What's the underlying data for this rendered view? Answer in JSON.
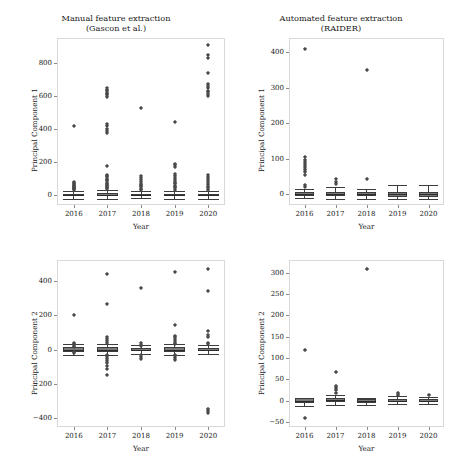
{
  "figure": {
    "xlabel": "Year",
    "categories": [
      "2016",
      "2017",
      "2018",
      "2019",
      "2020"
    ]
  },
  "panels": {
    "top_left": {
      "title": "Manual feature extraction\n(Gascon et al.)",
      "ylabel": "Principal Component 1",
      "yticks": [
        "0",
        "200",
        "400",
        "600",
        "800"
      ]
    },
    "top_right": {
      "title": "Automated feature extraction\n(RAIDER)",
      "ylabel": "Principal Component 1",
      "yticks": [
        "0",
        "100",
        "200",
        "300",
        "400"
      ]
    },
    "bottom_left": {
      "title": "",
      "ylabel": "Principal Component 2",
      "yticks": [
        "−400",
        "−200",
        "0",
        "200",
        "400"
      ]
    },
    "bottom_right": {
      "title": "",
      "ylabel": "Principal Component 2",
      "yticks": [
        "−50",
        "0",
        "50",
        "100",
        "150",
        "200",
        "250",
        "300"
      ]
    }
  },
  "chart_data": [
    {
      "id": "top_left",
      "type": "box",
      "title": "Manual feature extraction (Gascon et al.)",
      "xlabel": "Year",
      "ylabel": "Principal Component 1",
      "categories": [
        "2016",
        "2017",
        "2018",
        "2019",
        "2020"
      ],
      "ylim": [
        -60,
        950
      ],
      "yticks": [
        0,
        200,
        400,
        600,
        800
      ],
      "grid": false,
      "legend": "none",
      "boxes": [
        {
          "category": "2016",
          "q1": -6,
          "median": 0,
          "q3": 8,
          "whisker_low": -22,
          "whisker_high": 24,
          "outliers": [
            30,
            34,
            38,
            42,
            46,
            50,
            55,
            60,
            66,
            72,
            80,
            415
          ]
        },
        {
          "category": "2017",
          "q1": -8,
          "median": 0,
          "q3": 10,
          "whisker_low": -26,
          "whisker_high": 30,
          "outliers": [
            36,
            42,
            48,
            54,
            60,
            68,
            76,
            84,
            92,
            100,
            108,
            116,
            124,
            178,
            375,
            385,
            400,
            418,
            430,
            595,
            605,
            612,
            620,
            628,
            636,
            645
          ]
        },
        {
          "category": "2018",
          "q1": -6,
          "median": 0,
          "q3": 7,
          "whisker_low": -20,
          "whisker_high": 22,
          "outliers": [
            30,
            38,
            46,
            54,
            62,
            70,
            80,
            92,
            104,
            118,
            524
          ]
        },
        {
          "category": "2019",
          "q1": -7,
          "median": 0,
          "q3": 9,
          "whisker_low": -24,
          "whisker_high": 26,
          "outliers": [
            32,
            40,
            48,
            56,
            64,
            72,
            82,
            92,
            104,
            116,
            128,
            170,
            182,
            190,
            443
          ]
        },
        {
          "category": "2020",
          "q1": -6,
          "median": 0,
          "q3": 8,
          "whisker_low": -22,
          "whisker_high": 24,
          "outliers": [
            30,
            40,
            50,
            60,
            72,
            84,
            96,
            110,
            124,
            600,
            612,
            622,
            632,
            645,
            660,
            672,
            740,
            830,
            845,
            908
          ]
        }
      ]
    },
    {
      "id": "top_right",
      "type": "box",
      "title": "Automated feature extraction (RAIDER)",
      "xlabel": "Year",
      "ylabel": "Principal Component 1",
      "categories": [
        "2016",
        "2017",
        "2018",
        "2019",
        "2020"
      ],
      "ylim": [
        -30,
        440
      ],
      "yticks": [
        0,
        100,
        200,
        300,
        400
      ],
      "grid": false,
      "legend": "none",
      "boxes": [
        {
          "category": "2016",
          "q1": -4,
          "median": 1,
          "q3": 6,
          "whisker_low": -10,
          "whisker_high": 14,
          "outliers": [
            20,
            26,
            55,
            62,
            68,
            74,
            80,
            86,
            92,
            98,
            104,
            408
          ]
        },
        {
          "category": "2017",
          "q1": -6,
          "median": 0,
          "q3": 7,
          "whisker_low": -12,
          "whisker_high": 22,
          "outliers": [
            30,
            36,
            42
          ]
        },
        {
          "category": "2018",
          "q1": -6,
          "median": 0,
          "q3": 6,
          "whisker_low": -12,
          "whisker_high": 16,
          "outliers": [
            44,
            350
          ]
        },
        {
          "category": "2019",
          "q1": -7,
          "median": 0,
          "q3": 7,
          "whisker_low": -14,
          "whisker_high": 26,
          "outliers": []
        },
        {
          "category": "2020",
          "q1": -7,
          "median": 0,
          "q3": 7,
          "whisker_low": -14,
          "whisker_high": 26,
          "outliers": []
        }
      ]
    },
    {
      "id": "bottom_left",
      "type": "box",
      "title": "",
      "xlabel": "Year",
      "ylabel": "Principal Component 2",
      "categories": [
        "2016",
        "2017",
        "2018",
        "2019",
        "2020"
      ],
      "ylim": [
        -450,
        520
      ],
      "yticks": [
        -400,
        -200,
        0,
        200,
        400
      ],
      "grid": false,
      "legend": "none",
      "boxes": [
        {
          "category": "2016",
          "q1": -12,
          "median": 0,
          "q3": 12,
          "whisker_low": -30,
          "whisker_high": 30,
          "outliers": [
            -22,
            -14,
            14,
            22,
            30,
            38,
            200
          ]
        },
        {
          "category": "2017",
          "q1": -14,
          "median": 0,
          "q3": 14,
          "whisker_low": -34,
          "whisker_high": 34,
          "outliers": [
            -150,
            -112,
            -96,
            -80,
            -66,
            -54,
            -42,
            -32,
            36,
            48,
            60,
            72,
            265,
            438
          ]
        },
        {
          "category": "2018",
          "q1": -10,
          "median": 0,
          "q3": 10,
          "whisker_low": -26,
          "whisker_high": 26,
          "outliers": [
            -56,
            -44,
            -34,
            20,
            28,
            36,
            356
          ]
        },
        {
          "category": "2019",
          "q1": -12,
          "median": 0,
          "q3": 12,
          "whisker_low": -30,
          "whisker_high": 30,
          "outliers": [
            -60,
            -50,
            -40,
            -30,
            30,
            40,
            50,
            60,
            70,
            80,
            140,
            450
          ]
        },
        {
          "category": "2020",
          "q1": -10,
          "median": 0,
          "q3": 10,
          "whisker_low": -26,
          "whisker_high": 26,
          "outliers": [
            -370,
            -355,
            -344,
            30,
            40,
            75,
            85,
            110,
            340,
            470
          ]
        }
      ]
    },
    {
      "id": "bottom_right",
      "type": "box",
      "title": "",
      "xlabel": "Year",
      "ylabel": "Principal Component 2",
      "categories": [
        "2016",
        "2017",
        "2018",
        "2019",
        "2020"
      ],
      "ylim": [
        -62,
        330
      ],
      "yticks": [
        -50,
        0,
        50,
        100,
        150,
        200,
        250,
        300
      ],
      "grid": false,
      "legend": "none",
      "boxes": [
        {
          "category": "2016",
          "q1": -5,
          "median": 0,
          "q3": 5,
          "whisker_low": -13,
          "whisker_high": 5,
          "outliers": [
            -42,
            118
          ]
        },
        {
          "category": "2017",
          "q1": -4,
          "median": 1,
          "q3": 5,
          "whisker_low": -10,
          "whisker_high": 12,
          "outliers": [
            18,
            24,
            30,
            34,
            68
          ]
        },
        {
          "category": "2018",
          "q1": -5,
          "median": 0,
          "q3": 4,
          "whisker_low": -11,
          "whisker_high": 5,
          "outliers": [
            310
          ]
        },
        {
          "category": "2019",
          "q1": -3,
          "median": 0,
          "q3": 3,
          "whisker_low": -8,
          "whisker_high": 10,
          "outliers": [
            14,
            18
          ]
        },
        {
          "category": "2020",
          "q1": -3,
          "median": 0,
          "q3": 3,
          "whisker_low": -8,
          "whisker_high": 8,
          "outliers": [
            12
          ]
        }
      ]
    }
  ]
}
